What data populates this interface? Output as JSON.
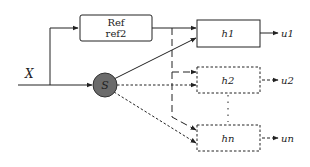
{
  "diagram": {
    "input_label": "X",
    "selector_label": "S",
    "ref_block": {
      "line1": "Ref",
      "line2": "ref2"
    },
    "blocks": [
      {
        "id": "h1",
        "label": "h1",
        "output": "u1",
        "style": "solid"
      },
      {
        "id": "h2",
        "label": "h2",
        "output": "u2",
        "style": "dashed"
      },
      {
        "id": "hn",
        "label": "hn",
        "output": "un",
        "style": "dashed"
      }
    ],
    "colors": {
      "stroke": "#222222",
      "selector_fill": "#6b6b6b",
      "background": "#ffffff"
    }
  }
}
